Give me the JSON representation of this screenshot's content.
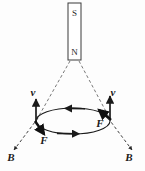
{
  "figure": {
    "background_color": "#fdfdfd",
    "ink_color": "#1a1a1a",
    "magnet": {
      "name": "bar-magnet",
      "top_pole_label": "S",
      "bottom_pole_label": "N",
      "x": 68,
      "y": 3,
      "width": 13,
      "height": 57
    },
    "loop": {
      "name": "current-loop",
      "center_x": 73,
      "center_y": 121,
      "radius_x": 37,
      "radius_y": 13,
      "current_arrow_top_direction": "left",
      "current_arrow_bottom_direction": "right"
    },
    "vectors": [
      {
        "id": "v-left",
        "label": "v",
        "label_x": 33,
        "label_y": 96,
        "kind": "velocity",
        "style": "solid",
        "x1": 36,
        "y1": 123,
        "x2": 36,
        "y2": 99
      },
      {
        "id": "v-right",
        "label": "v",
        "label_x": 113,
        "label_y": 96,
        "kind": "velocity",
        "style": "solid",
        "x1": 110,
        "y1": 120,
        "x2": 110,
        "y2": 96
      },
      {
        "id": "F-left",
        "label": "F",
        "label_x": 44,
        "label_y": 142,
        "kind": "force",
        "style": "solid-thick",
        "x1": 35,
        "y1": 121,
        "x2": 44,
        "y2": 134
      },
      {
        "id": "F-right",
        "label": "F",
        "label_x": 100,
        "label_y": 126,
        "kind": "force",
        "style": "solid-thick",
        "x1": 111,
        "y1": 120,
        "x2": 99,
        "y2": 110
      },
      {
        "id": "B-left",
        "label": "B",
        "label_x": 11,
        "label_y": 159,
        "kind": "magnetic-field",
        "style": "dashed",
        "x1": 38,
        "y1": 118,
        "x2": 14,
        "y2": 150
      },
      {
        "id": "B-right",
        "label": "B",
        "label_x": 128,
        "label_y": 159,
        "kind": "magnetic-field",
        "style": "dashed",
        "x1": 108,
        "y1": 118,
        "x2": 132,
        "y2": 150
      }
    ],
    "field_lines": [
      {
        "id": "field-line-left",
        "x1": 70,
        "y1": 61,
        "x2": 36,
        "y2": 121
      },
      {
        "id": "field-line-right",
        "x1": 79,
        "y1": 61,
        "x2": 110,
        "y2": 119
      }
    ]
  }
}
